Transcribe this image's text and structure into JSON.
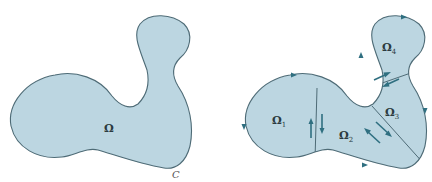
{
  "figure": {
    "left": {
      "region_label": "Ω",
      "boundary_label": "C"
    },
    "right": {
      "subregions": [
        {
          "label": "Ω",
          "sub": "1"
        },
        {
          "label": "Ω",
          "sub": "2"
        },
        {
          "label": "Ω",
          "sub": "3"
        },
        {
          "label": "Ω",
          "sub": "4"
        }
      ]
    },
    "colors": {
      "fill": "#bcd6e1",
      "stroke": "#4e6b76",
      "arrow": "#2f6f80"
    }
  }
}
